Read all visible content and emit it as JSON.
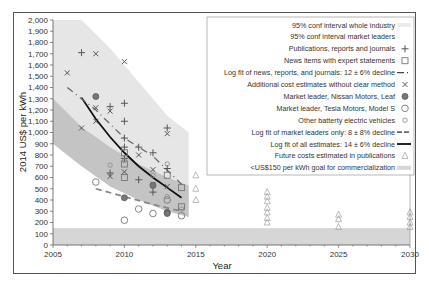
{
  "chart_data": {
    "type": "scatter",
    "title": "",
    "xlabel": "Year",
    "ylabel": "2014 US$ per kWh",
    "xlim": [
      2005,
      2030
    ],
    "ylim": [
      0,
      2000
    ],
    "x_ticks": [
      "2005",
      "2010",
      "2015",
      "2020",
      "2025",
      "2030"
    ],
    "y_ticks": [
      "0",
      "100",
      "200",
      "300",
      "400",
      "500",
      "600",
      "700",
      "800",
      "900",
      "1,000",
      "1,100",
      "1,200",
      "1,300",
      "1,400",
      "1,500",
      "1,600",
      "1,700",
      "1,800",
      "1,900",
      "2,000"
    ],
    "grid": false,
    "legend_position": "upper right",
    "legend": [
      "95% conf interval whole industry",
      "95% conf interval market leaders",
      "Publications, reports and journals",
      "News items with expert statements",
      "Log fit of news, reports, and journals: 12 ± 6% decline",
      "Additional cost estimates without clear method",
      "Market leader, Nissan Motors, Leaf",
      "Market leader, Tesla Motors, Model S",
      "Other batterty electric vehicles",
      "Log fit of market leaders only: 8 ± 8% decline",
      "Log fit of all estimates: 14 ± 6% decline",
      "Future costs estimated in publications",
      "<US$150 per kWh goal for commercialization"
    ],
    "series": [
      {
        "name": "Publications, reports and journals",
        "marker": "plus",
        "points": [
          [
            2007,
            1710
          ],
          [
            2009,
            1230
          ],
          [
            2010,
            1260
          ],
          [
            2010,
            1100
          ],
          [
            2010,
            950
          ],
          [
            2010,
            870
          ],
          [
            2011,
            870
          ],
          [
            2012,
            820
          ],
          [
            2009,
            640
          ],
          [
            2011,
            580
          ],
          [
            2012,
            470
          ],
          [
            2010,
            770
          ],
          [
            2013,
            1040
          ],
          [
            2013,
            680
          ]
        ]
      },
      {
        "name": "News items with expert statements",
        "marker": "square",
        "points": [
          [
            2010,
            820
          ],
          [
            2010,
            720
          ],
          [
            2010,
            600
          ],
          [
            2013,
            620
          ],
          [
            2014,
            510
          ],
          [
            2014,
            340
          ]
        ]
      },
      {
        "name": "Additional cost estimates without clear method",
        "marker": "x",
        "points": [
          [
            2006,
            1530
          ],
          [
            2008,
            1700
          ],
          [
            2010,
            1630
          ],
          [
            2008,
            1220
          ],
          [
            2009,
            1190
          ],
          [
            2008,
            1100
          ],
          [
            2007,
            1040
          ],
          [
            2013,
            990
          ],
          [
            2011,
            800
          ],
          [
            2012,
            670
          ],
          [
            2009,
            610
          ],
          [
            2010,
            650
          ],
          [
            2012,
            540
          ],
          [
            2013,
            520
          ]
        ]
      },
      {
        "name": "Market leader, Nissan Motors, Leaf",
        "marker": "filled-circle",
        "points": [
          [
            2008,
            1320
          ],
          [
            2010,
            420
          ],
          [
            2012,
            530
          ],
          [
            2013,
            290
          ],
          [
            2013,
            280
          ]
        ]
      },
      {
        "name": "Market leader, Tesla Motors, Model S",
        "marker": "circle",
        "points": [
          [
            2008,
            560
          ],
          [
            2010,
            220
          ],
          [
            2011,
            320
          ],
          [
            2012,
            280
          ],
          [
            2013,
            400
          ],
          [
            2014,
            260
          ]
        ]
      },
      {
        "name": "Other battery electric vehicles",
        "marker": "small-circle",
        "points": [
          [
            2009,
            710
          ],
          [
            2010,
            750
          ],
          [
            2012,
            620
          ],
          [
            2013,
            720
          ],
          [
            2013,
            430
          ],
          [
            2014,
            320
          ]
        ]
      },
      {
        "name": "Future costs estimated in publications",
        "marker": "triangle",
        "points": [
          [
            2015,
            620
          ],
          [
            2015,
            500
          ],
          [
            2015,
            400
          ],
          [
            2020,
            470
          ],
          [
            2020,
            430
          ],
          [
            2020,
            390
          ],
          [
            2020,
            330
          ],
          [
            2020,
            290
          ],
          [
            2020,
            240
          ],
          [
            2020,
            200
          ],
          [
            2025,
            270
          ],
          [
            2025,
            230
          ],
          [
            2025,
            160
          ],
          [
            2030,
            290
          ],
          [
            2030,
            250
          ],
          [
            2030,
            200
          ],
          [
            2030,
            160
          ]
        ]
      },
      {
        "name": "Log fit of all estimates: 14 ± 6% decline",
        "type": "line",
        "x": [
          2007,
          2008,
          2009,
          2010,
          2011,
          2012,
          2013,
          2014
        ],
        "y": [
          1310,
          1120,
          960,
          820,
          700,
          600,
          510,
          420
        ]
      },
      {
        "name": "Log fit of news, reports, and journals: 12 ± 6% decline",
        "type": "line",
        "x": [
          2006,
          2008,
          2010,
          2012,
          2014
        ],
        "y": [
          1400,
          1200,
          950,
          790,
          540
        ]
      },
      {
        "name": "Log fit of market leaders only: 8 ± 8% decline",
        "type": "line",
        "x": [
          2008,
          2010,
          2012,
          2014
        ],
        "y": [
          500,
          430,
          360,
          300
        ]
      }
    ],
    "bands": [
      {
        "name": "95% conf interval whole industry",
        "x": [
          2005,
          2007,
          2009,
          2011,
          2013,
          2014.5
        ],
        "upper": [
          2000,
          2000,
          1750,
          1450,
          1150,
          1000
        ],
        "lower": [
          1300,
          1000,
          600,
          430,
          330,
          250
        ]
      },
      {
        "name": "95% conf interval market leaders",
        "x": [
          2005,
          2007,
          2009,
          2011,
          2013,
          2014.5
        ],
        "upper": [
          1300,
          1050,
          870,
          720,
          600,
          530
        ],
        "lower": [
          900,
          700,
          520,
          400,
          300,
          250
        ]
      },
      {
        "name": "<US$150 per kWh goal for commercialization",
        "ymin": 0,
        "ymax": 150
      }
    ]
  }
}
